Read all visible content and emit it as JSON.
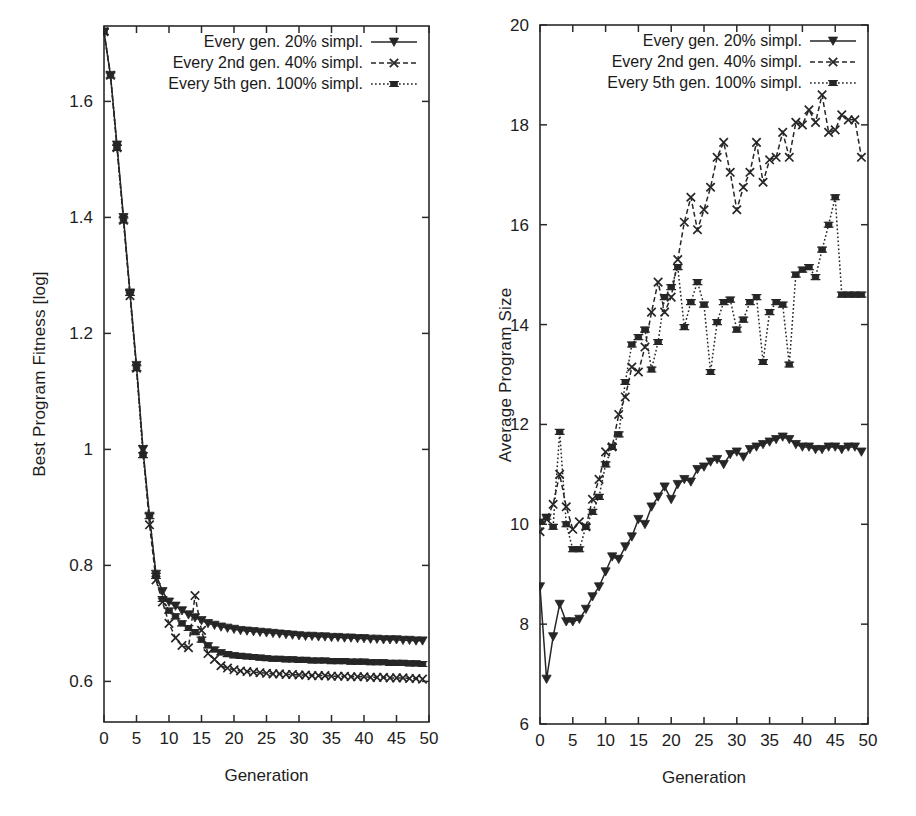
{
  "figure": {
    "panels": [
      "left",
      "right"
    ]
  },
  "chart_data": [
    {
      "id": "best-program-fitness",
      "type": "line",
      "title": "",
      "xlabel": "Generation",
      "ylabel": "Best Program Fitness [log]",
      "xlim": [
        0,
        50
      ],
      "ylim": [
        0.53,
        1.73
      ],
      "xticks": [
        0,
        5,
        10,
        15,
        20,
        25,
        30,
        35,
        40,
        45,
        50
      ],
      "xticklabels": [
        "0",
        "5",
        "10",
        "15",
        "20",
        "25",
        "30",
        "35",
        "40",
        "45",
        "50"
      ],
      "yticks": [
        0.6,
        0.8,
        1.0,
        1.2,
        1.4,
        1.6
      ],
      "yticklabels": [
        "0.6",
        "0.8",
        "1",
        "1.2",
        "1.4",
        "1.6"
      ],
      "grid": false,
      "legend_position": "top-center",
      "x": [
        0,
        1,
        2,
        3,
        4,
        5,
        6,
        7,
        8,
        9,
        10,
        11,
        12,
        13,
        14,
        15,
        16,
        17,
        18,
        19,
        20,
        21,
        22,
        23,
        24,
        25,
        26,
        27,
        28,
        29,
        30,
        31,
        32,
        33,
        34,
        35,
        36,
        37,
        38,
        39,
        40,
        41,
        42,
        43,
        44,
        45,
        46,
        47,
        48,
        49
      ],
      "series": [
        {
          "name": "Every gen. 20% simpl.",
          "marker": "triangle-down",
          "linestyle": "solid",
          "values": [
            1.72,
            1.645,
            1.525,
            1.4,
            1.27,
            1.145,
            1.0,
            0.885,
            0.785,
            0.755,
            0.737,
            0.73,
            0.722,
            0.715,
            0.71,
            0.705,
            0.7,
            0.697,
            0.694,
            0.692,
            0.69,
            0.688,
            0.687,
            0.686,
            0.685,
            0.684,
            0.683,
            0.682,
            0.681,
            0.68,
            0.679,
            0.678,
            0.678,
            0.677,
            0.677,
            0.676,
            0.676,
            0.675,
            0.675,
            0.674,
            0.674,
            0.673,
            0.673,
            0.672,
            0.672,
            0.672,
            0.671,
            0.671,
            0.67,
            0.67
          ]
        },
        {
          "name": "Every 2nd gen. 40% simpl.",
          "marker": "x",
          "linestyle": "dashed",
          "values": [
            1.72,
            1.645,
            1.52,
            1.395,
            1.265,
            1.14,
            1.0,
            0.87,
            0.775,
            0.737,
            0.7,
            0.675,
            0.662,
            0.658,
            0.748,
            0.688,
            0.648,
            0.638,
            0.627,
            0.623,
            0.62,
            0.618,
            0.617,
            0.616,
            0.615,
            0.614,
            0.613,
            0.613,
            0.612,
            0.612,
            0.611,
            0.611,
            0.61,
            0.61,
            0.61,
            0.609,
            0.609,
            0.609,
            0.608,
            0.608,
            0.608,
            0.607,
            0.607,
            0.607,
            0.606,
            0.606,
            0.606,
            0.605,
            0.605,
            0.604
          ]
        },
        {
          "name": "Every 5th gen. 100% simpl.",
          "marker": "square",
          "linestyle": "dotted",
          "values": [
            1.72,
            1.645,
            1.52,
            1.395,
            1.27,
            1.14,
            0.99,
            0.885,
            0.782,
            0.742,
            0.722,
            0.712,
            0.7,
            0.692,
            0.685,
            0.672,
            0.662,
            0.655,
            0.65,
            0.647,
            0.645,
            0.644,
            0.643,
            0.642,
            0.641,
            0.64,
            0.639,
            0.639,
            0.638,
            0.638,
            0.637,
            0.637,
            0.636,
            0.636,
            0.636,
            0.635,
            0.635,
            0.635,
            0.634,
            0.634,
            0.634,
            0.633,
            0.633,
            0.633,
            0.632,
            0.632,
            0.632,
            0.631,
            0.631,
            0.63
          ]
        }
      ]
    },
    {
      "id": "average-program-size",
      "type": "line",
      "title": "",
      "xlabel": "Generation",
      "ylabel": "Average Program Size",
      "xlim": [
        0,
        50
      ],
      "ylim": [
        6,
        20
      ],
      "xticks": [
        0,
        5,
        10,
        15,
        20,
        25,
        30,
        35,
        40,
        45,
        50
      ],
      "xticklabels": [
        "0",
        "5",
        "10",
        "15",
        "20",
        "25",
        "30",
        "35",
        "40",
        "45",
        "50"
      ],
      "yticks": [
        6,
        8,
        10,
        12,
        14,
        16,
        18,
        20
      ],
      "yticklabels": [
        "6",
        "8",
        "10",
        "12",
        "14",
        "16",
        "18",
        "20"
      ],
      "grid": false,
      "legend_position": "top-center",
      "x": [
        0,
        1,
        2,
        3,
        4,
        5,
        6,
        7,
        8,
        9,
        10,
        11,
        12,
        13,
        14,
        15,
        16,
        17,
        18,
        19,
        20,
        21,
        22,
        23,
        24,
        25,
        26,
        27,
        28,
        29,
        30,
        31,
        32,
        33,
        34,
        35,
        36,
        37,
        38,
        39,
        40,
        41,
        42,
        43,
        44,
        45,
        46,
        47,
        48,
        49
      ],
      "series": [
        {
          "name": "Every gen. 20% simpl.",
          "marker": "triangle-down",
          "linestyle": "solid",
          "values": [
            8.75,
            6.9,
            7.75,
            8.4,
            8.05,
            8.05,
            8.1,
            8.3,
            8.55,
            8.75,
            9.05,
            9.35,
            9.3,
            9.55,
            9.75,
            10.1,
            10.0,
            10.35,
            10.55,
            10.75,
            10.5,
            10.8,
            10.9,
            10.85,
            11.1,
            11.15,
            11.25,
            11.3,
            11.2,
            11.4,
            11.45,
            11.35,
            11.5,
            11.55,
            11.6,
            11.65,
            11.7,
            11.75,
            11.7,
            11.6,
            11.55,
            11.55,
            11.5,
            11.5,
            11.55,
            11.55,
            11.5,
            11.55,
            11.55,
            11.45
          ]
        },
        {
          "name": "Every 2nd gen. 40% simpl.",
          "marker": "x",
          "linestyle": "dashed",
          "values": [
            9.85,
            10.1,
            10.4,
            11.0,
            10.35,
            9.9,
            10.05,
            9.95,
            10.5,
            10.9,
            11.45,
            11.55,
            12.2,
            12.55,
            13.15,
            13.05,
            13.55,
            14.25,
            14.85,
            14.25,
            14.55,
            15.3,
            16.05,
            16.55,
            15.9,
            16.3,
            16.75,
            17.35,
            17.65,
            17.05,
            16.3,
            16.75,
            17.05,
            17.65,
            16.85,
            17.3,
            17.35,
            17.85,
            17.35,
            18.05,
            18.0,
            18.3,
            18.05,
            18.6,
            17.85,
            17.9,
            18.2,
            18.1,
            18.1,
            17.35
          ]
        },
        {
          "name": "Every 5th gen. 100% simpl.",
          "marker": "square",
          "linestyle": "dotted",
          "values": [
            10.05,
            10.15,
            9.95,
            11.85,
            10.0,
            9.5,
            9.5,
            9.95,
            10.25,
            10.55,
            11.2,
            11.55,
            11.8,
            12.85,
            13.6,
            13.75,
            13.9,
            13.1,
            13.65,
            14.55,
            14.75,
            15.15,
            13.95,
            14.45,
            14.85,
            14.4,
            13.05,
            14.05,
            14.45,
            14.5,
            13.9,
            14.1,
            14.45,
            14.55,
            13.25,
            14.25,
            14.45,
            14.4,
            13.2,
            15.0,
            15.1,
            15.15,
            14.95,
            15.5,
            16.0,
            16.55,
            14.6,
            14.6,
            14.6,
            14.6
          ]
        }
      ]
    }
  ]
}
